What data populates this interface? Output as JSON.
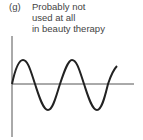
{
  "figure": {
    "label": "(g)",
    "caption_lines": [
      "Probably not",
      "used at all",
      "in beauty therapy"
    ]
  },
  "waveform": {
    "type": "sine",
    "cycles": 2.3,
    "stroke_color": "#222222",
    "axis_color": "#555555"
  }
}
